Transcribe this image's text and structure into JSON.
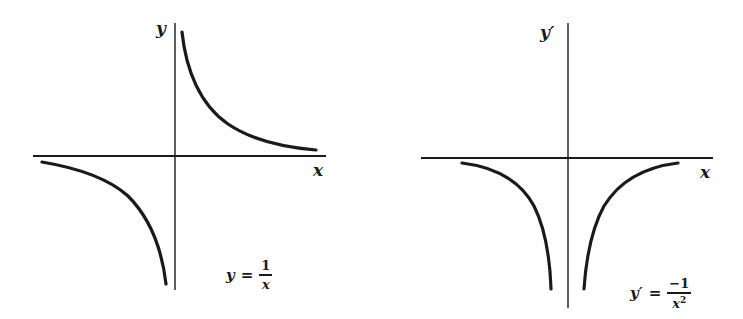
{
  "colors": {
    "ink": "#1a1a1a",
    "background": "#ffffff"
  },
  "graphs": [
    {
      "id": "function",
      "y_axis_label": "y",
      "x_axis_label": "x",
      "formula": {
        "lhs": "y",
        "eq": "=",
        "numerator": "1",
        "denominator": "x",
        "exponent": ""
      },
      "curve": "y = 1/x (hyperbola, branches in quadrants I and III)"
    },
    {
      "id": "derivative",
      "y_axis_label": "y′",
      "x_axis_label": "x",
      "formula": {
        "lhs": "y′",
        "eq": "=",
        "numerator": "−1",
        "denominator": "x",
        "exponent": "2"
      },
      "curve": "y′ = −1/x² (both branches below x-axis, symmetric about y-axis)"
    }
  ]
}
